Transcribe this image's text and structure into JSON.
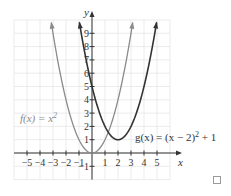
{
  "chart_data": {
    "type": "line",
    "title": "",
    "xlabel": "x",
    "ylabel": "y",
    "xlim": [
      -6,
      6
    ],
    "ylim": [
      -2,
      10
    ],
    "grid": true,
    "x_ticks": [
      "-5",
      "-4",
      "-3",
      "-2",
      "-1",
      "1",
      "2",
      "3",
      "4",
      "5"
    ],
    "y_ticks": [
      "-1",
      "1",
      "2",
      "3",
      "4",
      "5",
      "6",
      "7",
      "8",
      "9"
    ],
    "series": [
      {
        "name": "f(x) = x²",
        "label_text": "f(x) = x",
        "label_sup": "2",
        "expression": "x^2",
        "color": "#8a8a8a",
        "x": [
          -3,
          -2,
          -1,
          0,
          1,
          2,
          3
        ],
        "y": [
          9,
          4,
          1,
          0,
          1,
          4,
          9
        ],
        "vertex": [
          0,
          0
        ]
      },
      {
        "name": "g(x) = (x − 2)² + 1",
        "label_text": "g(x) = (x − 2)",
        "label_sup": "2",
        "label_tail": " + 1",
        "expression": "(x-2)^2+1",
        "color": "#333333",
        "x": [
          -1,
          0,
          1,
          2,
          3,
          4,
          5
        ],
        "y": [
          10,
          5,
          2,
          1,
          2,
          5,
          10
        ],
        "vertex": [
          2,
          1
        ]
      }
    ]
  },
  "ui": {
    "checkbox_checked": false
  }
}
